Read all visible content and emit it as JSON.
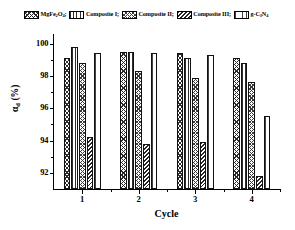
{
  "chart_data": {
    "type": "bar",
    "title": "",
    "xlabel": "Cycle",
    "ylabel": "αd (%)",
    "categories": [
      "1",
      "2",
      "3",
      "4"
    ],
    "ylim": [
      91,
      100.6
    ],
    "yticks": [
      92,
      94,
      96,
      98,
      100
    ],
    "ytick_labels": [
      "92",
      "94",
      "96",
      "98",
      "100"
    ],
    "xtick_labels": [
      "1",
      "2",
      "3",
      "4"
    ],
    "grid": false,
    "legend_position": "top",
    "series": [
      {
        "name": "MgFe2O4",
        "hatch": "h1",
        "values": [
          99.1,
          99.5,
          99.4,
          99.1
        ]
      },
      {
        "name": "Composite I",
        "hatch": "h2",
        "values": [
          99.8,
          99.5,
          99.1,
          98.8
        ]
      },
      {
        "name": "Composite II",
        "hatch": "h3",
        "values": [
          98.8,
          98.3,
          97.9,
          97.6
        ]
      },
      {
        "name": "Composite III",
        "hatch": "h4",
        "values": [
          94.2,
          93.8,
          93.9,
          91.8
        ]
      },
      {
        "name": "g-C3N4",
        "hatch": "h5",
        "values": [
          99.4,
          99.4,
          99.3,
          95.5
        ]
      }
    ]
  },
  "legend": {
    "items": [
      {
        "label_html": "MgFe<sub>2</sub>O<sub>4</sub>;",
        "name": "MgFe2O4",
        "hatch": "h1"
      },
      {
        "label_html": "Composite I;",
        "name": "Composite I",
        "hatch": "h2"
      },
      {
        "label_html": "Composite II;",
        "name": "Composite II",
        "hatch": "h3"
      },
      {
        "label_html": "Composite III;",
        "name": "Composite III",
        "hatch": "h4"
      },
      {
        "label_html": "g-C<sub>3</sub>N<sub>4</sub>",
        "name": "g-C3N4",
        "hatch": "h5"
      }
    ]
  },
  "axes": {
    "y_title_html": "α<sub>d</sub> (%)",
    "x_title": "Cycle"
  }
}
